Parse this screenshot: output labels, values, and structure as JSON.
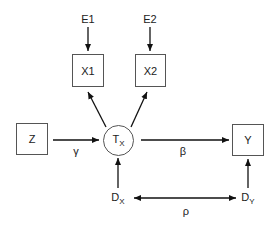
{
  "nodes": {
    "e1": "E1",
    "e2": "E2",
    "x1": "X1",
    "x2": "X2",
    "z": "Z",
    "tx": {
      "main": "T",
      "sub": "X"
    },
    "y": "Y",
    "dx": {
      "main": "D",
      "sub": "X"
    },
    "dy": {
      "main": "D",
      "sub": "Y"
    }
  },
  "paths": {
    "gamma": "γ",
    "beta": "β",
    "rho": "ρ"
  }
}
